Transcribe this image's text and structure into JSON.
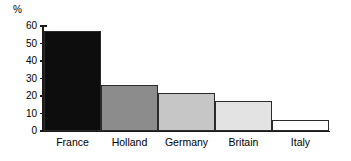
{
  "chart_data": {
    "type": "bar",
    "title": "",
    "subtitle": "",
    "xlabel": "",
    "ylabel": "%",
    "categories": [
      "France",
      "Holland",
      "Germany",
      "Britain",
      "Italy"
    ],
    "values": [
      57,
      26.5,
      21.5,
      17,
      6.5
    ],
    "ylim": [
      0,
      60
    ],
    "yticks": [
      0,
      10,
      20,
      30,
      40,
      50,
      60
    ],
    "ytick_labels": [
      "0",
      "10",
      "20",
      "30",
      "40",
      "50",
      "60"
    ],
    "grid": false,
    "legend": false,
    "legend_position": "none",
    "bar_colors": [
      "#0d0d0d",
      "#8c8c8c",
      "#c6c6c6",
      "#e3e3e3",
      "#ffffff"
    ],
    "bar_edge_color": "#2b2b2b",
    "background_color": "#ffffff",
    "axis_color": "#1a1a1a",
    "bar_gap": 0,
    "annotations": []
  },
  "axis": {
    "unit_label": "%"
  }
}
